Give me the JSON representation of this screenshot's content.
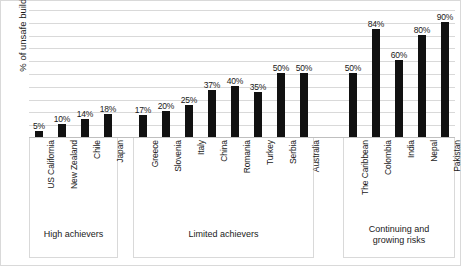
{
  "chart_data": {
    "type": "bar",
    "title": "",
    "xlabel": "",
    "ylabel": "% of unsafe buildings",
    "ylim": [
      0,
      100
    ],
    "grid": true,
    "legend": "none",
    "orientation": "vertical",
    "bar_color": "#111111",
    "gridline_color": "#d9d9d9",
    "gridline_values": [
      10,
      20,
      30,
      40,
      50,
      60,
      70,
      80,
      90,
      100
    ],
    "categories": [
      "US California",
      "New Zealand",
      "Chile",
      "Japan",
      "Greece",
      "Slovenia",
      "Italy",
      "China",
      "Romania",
      "Turkey",
      "Serbia",
      "Australia",
      "The Caribbean",
      "Colombia",
      "India",
      "Nepal",
      "Pakistan"
    ],
    "values": [
      5,
      10,
      14,
      18,
      17,
      20,
      25,
      37,
      40,
      35,
      50,
      50,
      50,
      84,
      60,
      80,
      90
    ],
    "data_labels": [
      "5%",
      "10%",
      "14%",
      "18%",
      "17%",
      "20%",
      "25%",
      "37%",
      "40%",
      "35%",
      "50%",
      "50%",
      "50%",
      "84%",
      "60%",
      "80%",
      "90%"
    ],
    "groups": [
      {
        "title": "High achievers",
        "start": 0,
        "count": 4
      },
      {
        "title": "Limited achievers",
        "start": 4,
        "count": 8
      },
      {
        "title": "Continuing and growing risks",
        "start": 12,
        "count": 5
      }
    ]
  }
}
